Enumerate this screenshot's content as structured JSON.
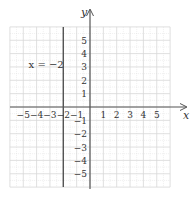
{
  "chart_data": {
    "type": "line",
    "title": "",
    "xlabel": "x",
    "ylabel": "y",
    "xlim": [
      -6,
      6
    ],
    "ylim": [
      -6,
      6
    ],
    "grid": true,
    "x_ticks": [
      -5,
      -4,
      -3,
      -2,
      -1,
      1,
      2,
      3,
      4,
      5
    ],
    "y_ticks": [
      5,
      4,
      3,
      2,
      1,
      -1,
      -2,
      -3,
      -4,
      -5
    ],
    "x_tick_labels": [
      "−5",
      "−4",
      "−3",
      "−2",
      "−1",
      "1",
      "2",
      "3",
      "4",
      "5"
    ],
    "y_tick_labels": [
      "5",
      "4",
      "3",
      "2",
      "1",
      "−1",
      "−2",
      "−3",
      "−4",
      "−5"
    ],
    "series": [
      {
        "name": "x = −2",
        "type": "vertical_line",
        "x": -2,
        "y_range": [
          -6,
          6
        ]
      }
    ],
    "annotations": [
      {
        "text": "x = −2",
        "x": -4.6,
        "y": 3.2
      }
    ],
    "colors": {
      "line": "#555555",
      "axis": "#555555",
      "grid": "#d8d8d8"
    }
  },
  "labels": {
    "x_axis": "x",
    "y_axis": "y",
    "equation": "x = −2"
  }
}
